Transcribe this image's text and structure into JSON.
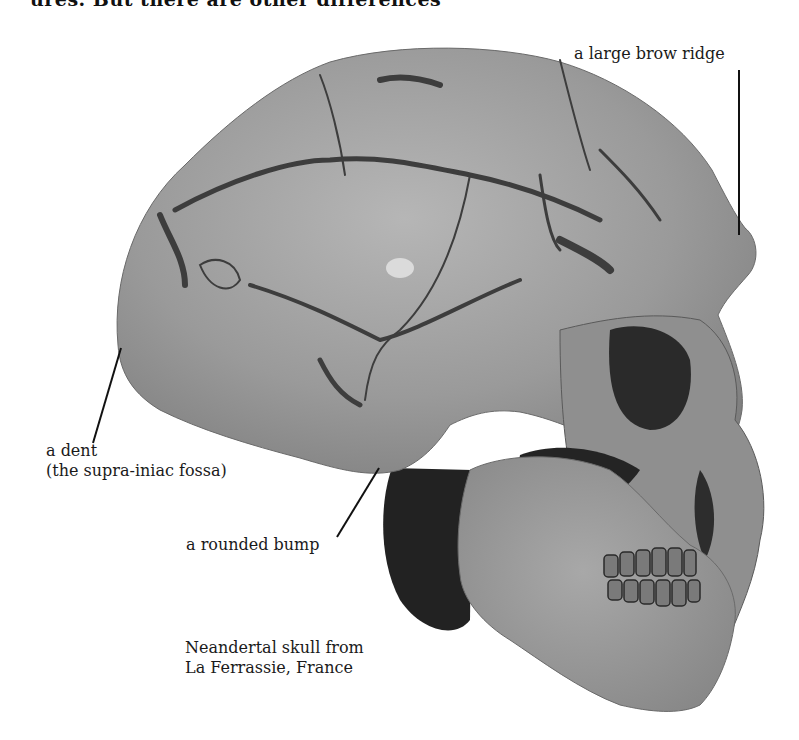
{
  "page": {
    "top_text_fragment": "ures. But there are other differences"
  },
  "figure": {
    "colors": {
      "bone": "#9c9c9c",
      "bone_light": "#b4b4b4",
      "crack": "#3a3a3a",
      "shadow": "#1e1e1e",
      "leader_line": "#111111"
    },
    "annotations": [
      {
        "id": "brow-ridge",
        "text": "a large brow ridge"
      },
      {
        "id": "dent",
        "line1": "a dent",
        "line2": "(the supra-iniac fossa)"
      },
      {
        "id": "bump",
        "text": "a rounded bump"
      }
    ],
    "caption": {
      "line1": "Neandertal skull from",
      "line2": "La Ferrassie, France"
    }
  }
}
